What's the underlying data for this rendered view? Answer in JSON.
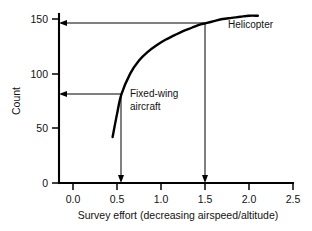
{
  "chart_data": {
    "type": "line",
    "title": "",
    "xlabel": "Survey effort (decreasing airspeed/altitude)",
    "ylabel": "Count",
    "xlim": [
      -0.1,
      2.6
    ],
    "ylim": [
      -6,
      160
    ],
    "xticks": [
      "0.0",
      "0.5",
      "1.0",
      "1.5",
      "2.0",
      "2.5"
    ],
    "xtick_values": [
      0.0,
      0.5,
      1.0,
      1.5,
      2.0,
      2.5
    ],
    "yticks": [
      "0",
      "50",
      "100",
      "150"
    ],
    "ytick_values": [
      0,
      50,
      100,
      150
    ],
    "grid": false,
    "legend": "none",
    "series": [
      {
        "name": "count-vs-survey-effort",
        "x": [
          0.45,
          0.5,
          0.55,
          0.65,
          0.75,
          0.85,
          0.95,
          1.05,
          1.15,
          1.25,
          1.35,
          1.45,
          1.5,
          1.6,
          1.7,
          1.8,
          1.9,
          2.0,
          2.1
        ],
        "values": [
          42,
          63,
          81,
          100,
          112,
          120,
          126,
          131,
          135,
          139,
          142,
          145,
          146,
          148,
          150,
          151,
          152,
          153,
          153
        ]
      }
    ],
    "annotations": [
      {
        "name": "fixed-wing-aircraft",
        "label_line1": "Fixed-wing",
        "label_line2": "aircraft",
        "x": 0.55,
        "y": 81
      },
      {
        "name": "helicopter",
        "label_line1": "Helicopter",
        "label_line2": "",
        "x": 1.5,
        "y": 146
      }
    ],
    "guides": [
      {
        "name": "fixed-wing-guide",
        "x": 0.55,
        "y": 81
      },
      {
        "name": "helicopter-guide",
        "x": 1.5,
        "y": 146
      }
    ]
  },
  "xticks": {
    "t0": "0.0",
    "t1": "0.5",
    "t2": "1.0",
    "t3": "1.5",
    "t4": "2.0",
    "t5": "2.5"
  },
  "yticks": {
    "t0": "0",
    "t1": "50",
    "t2": "100",
    "t3": "150"
  },
  "labels": {
    "xaxis": "Survey effort (decreasing airspeed/altitude)",
    "yaxis": "Count",
    "helicopter": "Helicopter",
    "fixedwing_line1": "Fixed-wing",
    "fixedwing_line2": "aircraft"
  }
}
